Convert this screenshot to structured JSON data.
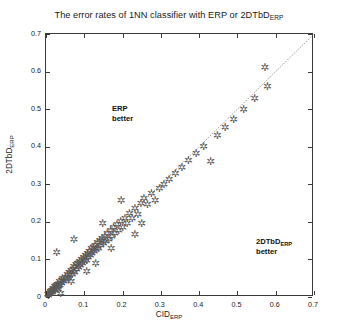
{
  "chart_data": {
    "type": "scatter",
    "title_main": "The error rates of 1NN classifier with ERP or 2DTbD",
    "title_sub": "ERP",
    "xlabel_main": "CID",
    "xlabel_sub": "ERP",
    "ylabel_main": "2DTbD",
    "ylabel_sub": "ERP",
    "xlim": [
      0,
      0.7
    ],
    "ylim": [
      0,
      0.7
    ],
    "xticks": [
      "0",
      "0.1",
      "0.2",
      "0.3",
      "0.4",
      "0.5",
      "0.6",
      "0.7"
    ],
    "yticks": [
      "0",
      "0.1",
      "0.2",
      "0.3",
      "0.4",
      "0.5",
      "0.6",
      "0.7"
    ],
    "xtick_values": [
      0,
      0.1,
      0.2,
      0.3,
      0.4,
      0.5,
      0.6,
      0.7
    ],
    "ytick_values": [
      0,
      0.1,
      0.2,
      0.3,
      0.4,
      0.5,
      0.6,
      0.7
    ],
    "grid": false,
    "legend": false,
    "marker": "asterisk",
    "marker_color": "#5a5a5a",
    "reference_line": {
      "type": "identity",
      "from": [
        0,
        0
      ],
      "to": [
        0.7,
        0.7
      ],
      "style": "dotted",
      "color": "#444444"
    },
    "annotations": [
      {
        "text_main": "ERP",
        "text_line2": "better",
        "x": 0.055,
        "y": 0.605,
        "region": "upper-left"
      },
      {
        "text_main": "2DTbD",
        "text_sub": "ERP",
        "text_line2": "better",
        "x": 0.43,
        "y": 0.25,
        "region": "lower-right"
      }
    ],
    "points": [
      [
        0.004,
        0.006
      ],
      [
        0.006,
        0.004
      ],
      [
        0.008,
        0.01
      ],
      [
        0.01,
        0.008
      ],
      [
        0.011,
        0.014
      ],
      [
        0.013,
        0.011
      ],
      [
        0.014,
        0.018
      ],
      [
        0.016,
        0.013
      ],
      [
        0.018,
        0.022
      ],
      [
        0.019,
        0.016
      ],
      [
        0.021,
        0.02
      ],
      [
        0.022,
        0.027
      ],
      [
        0.024,
        0.018
      ],
      [
        0.026,
        0.03
      ],
      [
        0.028,
        0.024
      ],
      [
        0.03,
        0.033
      ],
      [
        0.031,
        0.021
      ],
      [
        0.033,
        0.028
      ],
      [
        0.035,
        0.04
      ],
      [
        0.036,
        0.031
      ],
      [
        0.038,
        0.008
      ],
      [
        0.04,
        0.044
      ],
      [
        0.041,
        0.036
      ],
      [
        0.043,
        0.048
      ],
      [
        0.028,
        0.118
      ],
      [
        0.047,
        0.04
      ],
      [
        0.05,
        0.052
      ],
      [
        0.052,
        0.046
      ],
      [
        0.055,
        0.06
      ],
      [
        0.058,
        0.05
      ],
      [
        0.06,
        0.064
      ],
      [
        0.062,
        0.056
      ],
      [
        0.065,
        0.07
      ],
      [
        0.068,
        0.06
      ],
      [
        0.07,
        0.074
      ],
      [
        0.072,
        0.082
      ],
      [
        0.075,
        0.066
      ],
      [
        0.078,
        0.086
      ],
      [
        0.08,
        0.072
      ],
      [
        0.082,
        0.09
      ],
      [
        0.085,
        0.078
      ],
      [
        0.066,
        0.04
      ],
      [
        0.088,
        0.094
      ],
      [
        0.09,
        0.084
      ],
      [
        0.092,
        0.1
      ],
      [
        0.095,
        0.088
      ],
      [
        0.098,
        0.104
      ],
      [
        0.1,
        0.094
      ],
      [
        0.073,
        0.152
      ],
      [
        0.103,
        0.11
      ],
      [
        0.106,
        0.098
      ],
      [
        0.108,
        0.116
      ],
      [
        0.11,
        0.106
      ],
      [
        0.113,
        0.122
      ],
      [
        0.116,
        0.11
      ],
      [
        0.118,
        0.128
      ],
      [
        0.12,
        0.116
      ],
      [
        0.123,
        0.132
      ],
      [
        0.126,
        0.12
      ],
      [
        0.128,
        0.138
      ],
      [
        0.131,
        0.126
      ],
      [
        0.134,
        0.144
      ],
      [
        0.137,
        0.13
      ],
      [
        0.14,
        0.15
      ],
      [
        0.106,
        0.068
      ],
      [
        0.143,
        0.136
      ],
      [
        0.146,
        0.156
      ],
      [
        0.15,
        0.142
      ],
      [
        0.153,
        0.162
      ],
      [
        0.156,
        0.148
      ],
      [
        0.13,
        0.088
      ],
      [
        0.16,
        0.168
      ],
      [
        0.164,
        0.154
      ],
      [
        0.168,
        0.176
      ],
      [
        0.172,
        0.16
      ],
      [
        0.176,
        0.184
      ],
      [
        0.18,
        0.17
      ],
      [
        0.148,
        0.196
      ],
      [
        0.185,
        0.192
      ],
      [
        0.19,
        0.178
      ],
      [
        0.195,
        0.2
      ],
      [
        0.2,
        0.186
      ],
      [
        0.206,
        0.21
      ],
      [
        0.212,
        0.196
      ],
      [
        0.17,
        0.128
      ],
      [
        0.218,
        0.222
      ],
      [
        0.225,
        0.208
      ],
      [
        0.232,
        0.236
      ],
      [
        0.196,
        0.258
      ],
      [
        0.24,
        0.22
      ],
      [
        0.248,
        0.25
      ],
      [
        0.232,
        0.166
      ],
      [
        0.256,
        0.262
      ],
      [
        0.265,
        0.246
      ],
      [
        0.275,
        0.276
      ],
      [
        0.285,
        0.258
      ],
      [
        0.296,
        0.29
      ],
      [
        0.25,
        0.196
      ],
      [
        0.308,
        0.3
      ],
      [
        0.322,
        0.312
      ],
      [
        0.338,
        0.33
      ],
      [
        0.355,
        0.344
      ],
      [
        0.372,
        0.362
      ],
      [
        0.392,
        0.382
      ],
      [
        0.412,
        0.4
      ],
      [
        0.43,
        0.36
      ],
      [
        0.448,
        0.43
      ],
      [
        0.468,
        0.452
      ],
      [
        0.49,
        0.472
      ],
      [
        0.516,
        0.5
      ],
      [
        0.545,
        0.528
      ],
      [
        0.572,
        0.61
      ],
      [
        0.578,
        0.56
      ]
    ]
  }
}
